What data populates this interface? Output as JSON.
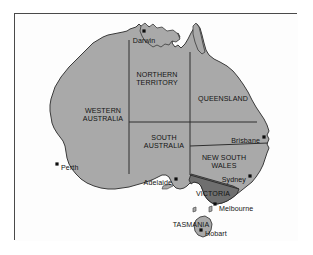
{
  "figure": {
    "frame_color": "#4a4a4a",
    "background_color": "#ffffff"
  },
  "map": {
    "landmass_name": "Australia",
    "colors": {
      "land_fill": "#a9a9a9",
      "highlight_fill": "#6f6f6f",
      "outline": "#3a3a3a",
      "border_line": "#2f2f2f",
      "label_text": "#141414",
      "city_dot": "#0d0d0d",
      "ocean": "#fdfdfd"
    },
    "states": [
      {
        "id": "wa",
        "label_line1": "WESTERN",
        "label_line2": "AUSTRALIA",
        "x": 88,
        "y": 99,
        "highlight": false
      },
      {
        "id": "nt",
        "label_line1": "NORTHERN",
        "label_line2": "TERRITORY",
        "x": 142,
        "y": 63,
        "highlight": false
      },
      {
        "id": "qld",
        "label_line1": "QUEENSLAND",
        "label_line2": "",
        "x": 208,
        "y": 87,
        "highlight": false
      },
      {
        "id": "sa",
        "label_line1": "SOUTH",
        "label_line2": "AUSTRALIA",
        "x": 149,
        "y": 126,
        "highlight": false
      },
      {
        "id": "nsw",
        "label_line1": "NEW SOUTH",
        "label_line2": "WALES",
        "x": 209,
        "y": 146,
        "highlight": false
      },
      {
        "id": "vic",
        "label_line1": "VICTORIA",
        "label_line2": "",
        "x": 198,
        "y": 182,
        "highlight": true
      },
      {
        "id": "tas",
        "label_line1": "TASMANIA",
        "label_line2": "",
        "x": 176,
        "y": 213,
        "highlight": false
      }
    ],
    "cities": [
      {
        "id": "darwin",
        "name": "Darwin",
        "dot_x": 129,
        "dot_y": 17,
        "label_x": 129,
        "label_y": 26,
        "anchor": "middle"
      },
      {
        "id": "brisbane",
        "name": "Brisbane",
        "dot_x": 249,
        "dot_y": 123,
        "label_x": 245,
        "label_y": 126,
        "anchor": "end"
      },
      {
        "id": "perth",
        "name": "Perth",
        "dot_x": 42,
        "dot_y": 150,
        "label_x": 46,
        "label_y": 153,
        "anchor": "start"
      },
      {
        "id": "sydney",
        "name": "Sydney",
        "dot_x": 235,
        "dot_y": 162,
        "label_x": 231,
        "label_y": 165,
        "anchor": "end"
      },
      {
        "id": "adelaide",
        "name": "Adelaide",
        "dot_x": 161,
        "dot_y": 165,
        "label_x": 157,
        "label_y": 168,
        "anchor": "end"
      },
      {
        "id": "melbourne",
        "name": "Melbourne",
        "dot_x": 200,
        "dot_y": 190,
        "label_x": 204,
        "label_y": 194,
        "anchor": "start"
      },
      {
        "id": "hobart",
        "name": "Hobart",
        "dot_x": 186,
        "dot_y": 216,
        "label_x": 190,
        "label_y": 219,
        "anchor": "start"
      }
    ]
  }
}
